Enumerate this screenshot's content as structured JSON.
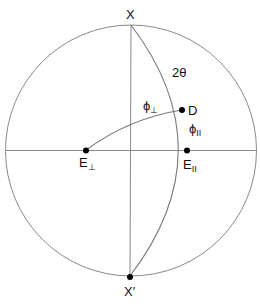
{
  "diagram": {
    "type": "stereographic-projection",
    "primitive_circle": {
      "cx": 131,
      "cy": 150,
      "r": 126
    },
    "points": {
      "X": {
        "label": "X",
        "x": 131,
        "y": 24
      },
      "X_prime": {
        "label": "X′",
        "x": 130,
        "y": 277
      },
      "D": {
        "label": "D",
        "x": 182,
        "y": 110
      },
      "E_parallel": {
        "label": "E",
        "subscript": "II",
        "x": 187,
        "y": 151
      },
      "E_perp": {
        "label": "E",
        "subscript": "⊥",
        "x": 86,
        "y": 150
      }
    },
    "angle_labels": {
      "two_theta": "2θ",
      "phi_perp": {
        "symbol": "ϕ",
        "subscript": "⊥"
      },
      "phi_parallel": {
        "symbol": "ϕ",
        "subscript": "II"
      }
    },
    "colors": {
      "lines": "#8a8a8a",
      "points": "#000000",
      "text": "#111111",
      "background": "#ffffff"
    }
  }
}
